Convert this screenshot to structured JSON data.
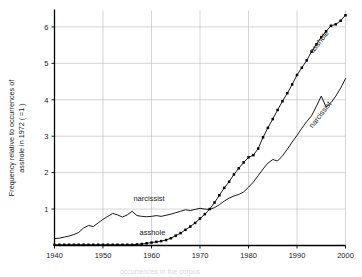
{
  "chart_data": {
    "type": "line",
    "title": "",
    "subtitle": "",
    "xlabel": "",
    "ylabel": "Frequency relative to occurrences of asshole in 1972 ( =1 )",
    "ylabel_line1": "Frequency relative to occurrences of",
    "ylabel_line2": "asshole in 1972 ( =1 )",
    "xlim": [
      1940,
      2000
    ],
    "ylim": [
      0,
      6.45
    ],
    "xticks": [
      1940,
      1950,
      1960,
      1970,
      1980,
      1990,
      2000
    ],
    "xtick_labels": [
      "1940",
      "1950",
      "1960",
      "1970",
      "1980",
      "1990",
      "2000"
    ],
    "yticks": [
      1,
      2,
      3,
      4,
      5,
      6
    ],
    "ytick_labels": [
      "1",
      "2",
      "3",
      "4",
      "5",
      "6"
    ],
    "grid": true,
    "grid_axes": "both",
    "legend": "inline-annotations",
    "annotations": [
      {
        "text": "narcissist",
        "x": 1959.5,
        "y": 1.22,
        "rotation": 0
      },
      {
        "text": "asshole",
        "x": 1960.2,
        "y": 0.3,
        "rotation": 0
      },
      {
        "text": "asshole",
        "x": 1995.0,
        "y": 5.55,
        "rotation": -52
      },
      {
        "text": "narcissist",
        "x": 1995.2,
        "y": 3.55,
        "rotation": -52
      }
    ],
    "series": [
      {
        "name": "asshole",
        "color": "#000000",
        "marker": "square",
        "x": [
          1940,
          1941,
          1942,
          1943,
          1944,
          1945,
          1946,
          1947,
          1948,
          1949,
          1950,
          1951,
          1952,
          1953,
          1954,
          1955,
          1956,
          1957,
          1958,
          1959,
          1960,
          1961,
          1962,
          1963,
          1964,
          1965,
          1966,
          1967,
          1968,
          1969,
          1970,
          1971,
          1972,
          1973,
          1974,
          1975,
          1976,
          1977,
          1978,
          1979,
          1980,
          1981,
          1982,
          1983,
          1984,
          1985,
          1986,
          1987,
          1988,
          1989,
          1990,
          1991,
          1992,
          1993,
          1994,
          1995,
          1996,
          1997,
          1998,
          1999,
          2000
        ],
        "values": [
          0.02,
          0.02,
          0.02,
          0.02,
          0.02,
          0.02,
          0.02,
          0.02,
          0.02,
          0.02,
          0.02,
          0.02,
          0.02,
          0.02,
          0.02,
          0.02,
          0.02,
          0.03,
          0.04,
          0.06,
          0.08,
          0.1,
          0.12,
          0.15,
          0.2,
          0.27,
          0.34,
          0.43,
          0.52,
          0.62,
          0.74,
          0.86,
          1.0,
          1.18,
          1.38,
          1.58,
          1.75,
          1.95,
          2.12,
          2.28,
          2.42,
          2.48,
          2.66,
          2.97,
          3.23,
          3.47,
          3.72,
          3.96,
          4.18,
          4.42,
          4.68,
          4.88,
          5.08,
          5.32,
          5.52,
          5.72,
          5.88,
          6.03,
          6.07,
          6.17,
          6.32
        ]
      },
      {
        "name": "narcissist",
        "color": "#000000",
        "marker": "none",
        "x": [
          1940,
          1941,
          1942,
          1943,
          1944,
          1945,
          1946,
          1947,
          1948,
          1949,
          1950,
          1951,
          1952,
          1953,
          1954,
          1955,
          1956,
          1957,
          1958,
          1959,
          1960,
          1961,
          1962,
          1963,
          1964,
          1965,
          1966,
          1967,
          1968,
          1969,
          1970,
          1971,
          1972,
          1973,
          1974,
          1975,
          1976,
          1977,
          1978,
          1979,
          1980,
          1981,
          1982,
          1983,
          1984,
          1985,
          1986,
          1987,
          1988,
          1989,
          1990,
          1991,
          1992,
          1993,
          1994,
          1995,
          1996,
          1997,
          1998,
          1999,
          2000
        ],
        "values": [
          0.19,
          0.2,
          0.23,
          0.26,
          0.3,
          0.36,
          0.48,
          0.55,
          0.52,
          0.62,
          0.72,
          0.8,
          0.88,
          0.84,
          0.78,
          0.84,
          0.94,
          0.82,
          0.8,
          0.79,
          0.8,
          0.82,
          0.8,
          0.83,
          0.86,
          0.9,
          0.94,
          0.98,
          0.96,
          0.99,
          1.02,
          1.0,
          0.99,
          1.04,
          1.12,
          1.22,
          1.3,
          1.36,
          1.4,
          1.47,
          1.6,
          1.74,
          1.92,
          2.1,
          2.26,
          2.36,
          2.32,
          2.46,
          2.64,
          2.84,
          3.02,
          3.22,
          3.4,
          3.56,
          3.82,
          4.1,
          3.8,
          3.92,
          4.1,
          4.32,
          4.58
        ]
      }
    ],
    "footer_ghost_text": "occurrences in the corpus"
  },
  "colors": {
    "line": "#000000",
    "grid": "#b9b9b9",
    "axis": "#000000",
    "background": "#ffffff"
  }
}
